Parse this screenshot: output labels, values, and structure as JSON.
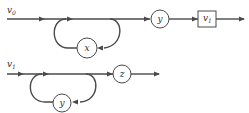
{
  "diagram": {
    "top": {
      "input_label": "v",
      "input_sub": "0",
      "loop_node": "x",
      "node_y": "y",
      "box_label": "v",
      "box_sub": "1"
    },
    "bottom": {
      "input_label": "v",
      "input_sub": "1",
      "loop_node": "y",
      "node_z": "z"
    }
  },
  "colors": {
    "stroke": "#4a4a4a",
    "background": "#ffffff"
  }
}
